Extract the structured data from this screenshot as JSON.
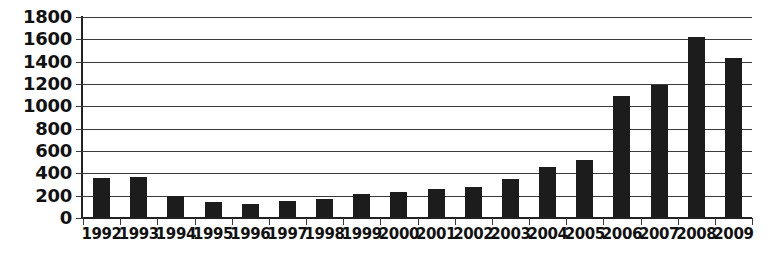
{
  "chart_data": {
    "type": "bar",
    "title": "",
    "subtitle": "",
    "xlabel": "",
    "ylabel": "",
    "categories": [
      "1992",
      "1993",
      "1994",
      "1995",
      "1996",
      "1997",
      "1998",
      "1999",
      "2000",
      "2001",
      "2002",
      "2003",
      "2004",
      "2005",
      "2006",
      "2007",
      "2008",
      "2009"
    ],
    "values": [
      345,
      360,
      190,
      135,
      120,
      140,
      160,
      205,
      220,
      250,
      270,
      340,
      450,
      510,
      1080,
      1185,
      1615,
      1425
    ],
    "series": [
      {
        "name": "",
        "values": [
          345,
          360,
          190,
          135,
          120,
          140,
          160,
          205,
          220,
          250,
          270,
          340,
          450,
          510,
          1080,
          1185,
          1615,
          1425
        ]
      }
    ],
    "ylim": [
      0,
      1800
    ],
    "ytick_values": [
      0,
      200,
      400,
      600,
      800,
      1000,
      1200,
      1400,
      1600,
      1800
    ],
    "ytick_labels": [
      "0",
      "200",
      "400",
      "600",
      "800",
      "1000",
      "1200",
      "1400",
      "1600",
      "1800"
    ],
    "xtick_labels": [
      "1992",
      "1993",
      "1994",
      "1995",
      "1996",
      "1997",
      "1998",
      "1999",
      "2000",
      "2001",
      "2002",
      "2003",
      "2004",
      "2005",
      "2006",
      "2007",
      "2008",
      "2009"
    ],
    "grid": true,
    "grid_axis": "y",
    "legend": false,
    "legend_position": "none",
    "annotations": [],
    "colors": {
      "bar": "#1c1c1c",
      "gridline": "#3a3a3a",
      "axis": "#222222",
      "background": "#ffffff",
      "text": "#111111"
    }
  }
}
